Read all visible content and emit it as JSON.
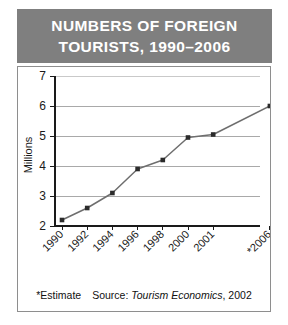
{
  "title": {
    "line1": "NUMBERS OF FOREIGN",
    "line2": "TOURISTS, 1990–2006"
  },
  "footer": {
    "estimate_note": "*Estimate",
    "source_prefix": "Source: ",
    "source_name": "Tourism Economics",
    "source_year": ", 2002"
  },
  "colors": {
    "title_bar": "#7f7f7f",
    "title_text": "#ffffff",
    "panel_border": "#8e8e8e",
    "axis": "#1a1a1a",
    "gridline": "#a9a9a9",
    "series_line": "#6e6e6e",
    "marker": "#2b2b2b",
    "background": "#ffffff"
  },
  "chart_data": {
    "type": "line",
    "title": "NUMBERS OF FOREIGN TOURISTS, 1990–2006",
    "xlabel": "",
    "ylabel": "Millions",
    "ylim": [
      2,
      7
    ],
    "yticks": [
      2,
      3,
      4,
      5,
      6,
      7
    ],
    "ytick_labels": [
      "2",
      "3",
      "4",
      "5",
      "6",
      "7"
    ],
    "categories": [
      "1990",
      "1992",
      "1994",
      "1996",
      "1998",
      "2000",
      "2001",
      "*2006"
    ],
    "values": [
      2.2,
      2.6,
      3.1,
      3.9,
      4.2,
      4.95,
      5.05,
      6.0
    ],
    "grid": true,
    "grid_axis": "y",
    "legend": false,
    "markers": true,
    "annotations": [
      "*Estimate",
      "Source: Tourism Economics, 2002"
    ]
  }
}
